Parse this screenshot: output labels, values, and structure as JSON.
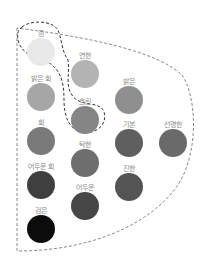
{
  "diagram": {
    "tones": [
      {
        "id": "white",
        "label": "흰",
        "color": "#e9e9e9",
        "x": 41,
        "ly": 30,
        "cy": 38
      },
      {
        "id": "pale",
        "label": "연한",
        "color": "#b3b3b3",
        "x": 85,
        "ly": 52,
        "cy": 60
      },
      {
        "id": "lightgray",
        "label": "밝은 회",
        "color": "#a6a6a6",
        "x": 41,
        "ly": 75,
        "cy": 83
      },
      {
        "id": "light",
        "label": "밝은",
        "color": "#8f8f8f",
        "x": 129,
        "ly": 78,
        "cy": 86
      },
      {
        "id": "dull",
        "label": "흐린",
        "color": "#858585",
        "x": 85,
        "ly": 98,
        "cy": 106
      },
      {
        "id": "gray",
        "label": "회",
        "color": "#7a7a7a",
        "x": 41,
        "ly": 119,
        "cy": 127
      },
      {
        "id": "grayish",
        "label": "탁한",
        "color": "#6e6e6e",
        "x": 85,
        "ly": 141,
        "cy": 149
      },
      {
        "id": "strong",
        "label": "기본",
        "color": "#5f5f5f",
        "x": 129,
        "ly": 121,
        "cy": 129
      },
      {
        "id": "vivid",
        "label": "선명한",
        "color": "#6a6a6a",
        "x": 173,
        "ly": 121,
        "cy": 129
      },
      {
        "id": "darkgray",
        "label": "어두운 회",
        "color": "#3f3f3f",
        "x": 41,
        "ly": 163,
        "cy": 171
      },
      {
        "id": "dark",
        "label": "어두운",
        "color": "#474747",
        "x": 85,
        "ly": 184,
        "cy": 192
      },
      {
        "id": "deep",
        "label": "진한",
        "color": "#545454",
        "x": 129,
        "ly": 165,
        "cy": 173
      },
      {
        "id": "black",
        "label": "검은",
        "color": "#0c0c0c",
        "x": 41,
        "ly": 207,
        "cy": 215
      }
    ]
  }
}
